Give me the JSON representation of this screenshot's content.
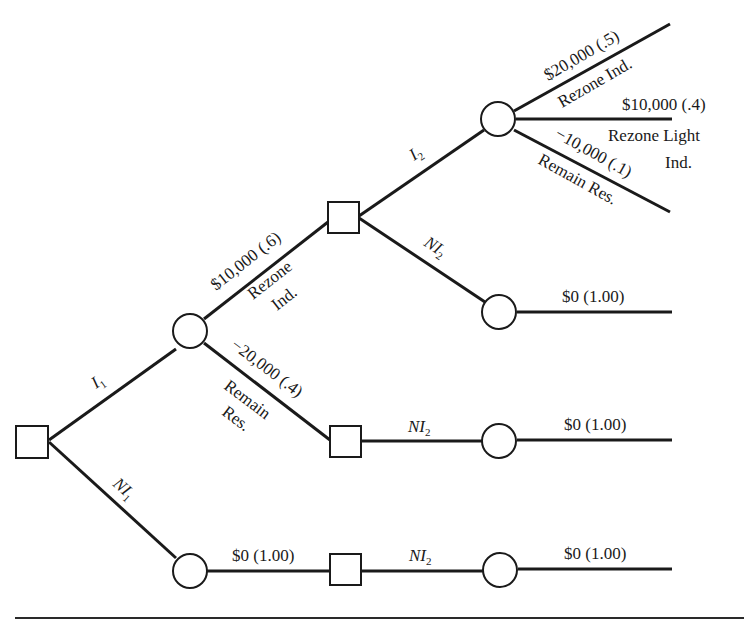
{
  "diagram": {
    "type": "decision-tree",
    "legend": {
      "square": "decision node",
      "circle": "chance node"
    },
    "branches": {
      "I1": {
        "label": "I",
        "sub": "1"
      },
      "NI1": {
        "label": "NI",
        "sub": "1"
      },
      "I2": {
        "label": "I",
        "sub": "2"
      },
      "NI2_upper": {
        "label": "NI",
        "sub": "2"
      },
      "NI2_middle": {
        "label": "NI",
        "sub": "2"
      },
      "NI2_lower": {
        "label": "NI",
        "sub": "2"
      }
    },
    "outcomes": {
      "rezone_ind_1": {
        "value": "$10,000 (.6)",
        "line1": "Rezone",
        "line2": "Ind."
      },
      "remain_res_1": {
        "value": "−20,000 (.4)",
        "line1": "Remain",
        "line2": "Res."
      },
      "rezone_ind_2": {
        "value": "$20,000 (.5)",
        "desc": "Rezone Ind."
      },
      "rezone_light_2": {
        "value": "$10,000 (.4)",
        "line1": "Rezone Light",
        "line2": "Ind."
      },
      "remain_res_2": {
        "value": "−10,000 (.1)",
        "desc": "Remain Res."
      },
      "zero_ni2_top": {
        "value": "$0 (1.00)"
      },
      "zero_ni2_mid": {
        "value": "$0 (1.00)"
      },
      "zero_ni1": {
        "value": "$0 (1.00)"
      },
      "zero_ni1_end": {
        "value": "$0 (1.00)"
      }
    }
  }
}
